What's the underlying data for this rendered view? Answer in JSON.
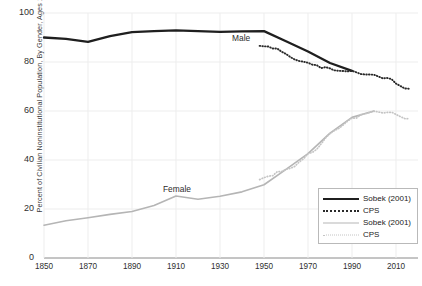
{
  "chart_data": {
    "type": "line",
    "title": "",
    "xlabel": "",
    "ylabel": "Percent of Civilian Noninstitutional Population, By Gender, Ages 16+",
    "xlim": [
      1850,
      2020
    ],
    "ylim": [
      0,
      100
    ],
    "xticks": [
      "1850",
      "1870",
      "1890",
      "1910",
      "1930",
      "1950",
      "1970",
      "1990",
      "2010"
    ],
    "xtick_values": [
      1850,
      1870,
      1890,
      1910,
      1930,
      1950,
      1970,
      1990,
      2010
    ],
    "yticks": [
      "0",
      "20",
      "40",
      "60",
      "80",
      "100"
    ],
    "ytick_values": [
      0,
      20,
      40,
      60,
      80,
      100
    ],
    "grid": true,
    "legend_position": "bottom-right",
    "annotations": [
      {
        "text": "Male",
        "x": 1952,
        "y": 88
      },
      {
        "text": "Female",
        "x": 1918,
        "y": 33
      }
    ],
    "legend": [
      {
        "label": "Sobek (2001)",
        "style": "solid",
        "color": "#1f1f1f",
        "width": 2.6
      },
      {
        "label": "CPS",
        "style": "dotted",
        "color": "#2a2a2a",
        "width": 2.0
      },
      {
        "label": "Sobek (2001)",
        "style": "solid",
        "color": "#b5b5b5",
        "width": 1.6
      },
      {
        "label": "CPS",
        "style": "dotted",
        "color": "#c4c4c4",
        "width": 1.6
      }
    ],
    "series": [
      {
        "name": "Male Sobek (2001)",
        "gender": "male",
        "source": "Sobek (2001)",
        "style": "solid",
        "color": "#1f1f1f",
        "x": [
          1850,
          1860,
          1870,
          1880,
          1890,
          1900,
          1910,
          1920,
          1930,
          1940,
          1950,
          1960,
          1970,
          1980,
          1990
        ],
        "values": [
          90.0,
          89.4,
          88.2,
          90.6,
          92.2,
          92.6,
          92.9,
          92.6,
          92.3,
          92.5,
          92.6,
          88.5,
          84.3,
          79.6,
          76.4
        ]
      },
      {
        "name": "Male CPS",
        "gender": "male",
        "source": "CPS",
        "style": "dotted",
        "color": "#2a2a2a",
        "x": [
          1948,
          1950,
          1952,
          1954,
          1956,
          1958,
          1960,
          1962,
          1964,
          1966,
          1968,
          1970,
          1972,
          1974,
          1976,
          1978,
          1980,
          1982,
          1984,
          1986,
          1988,
          1990,
          1992,
          1994,
          1996,
          1998,
          2000,
          2002,
          2004,
          2006,
          2008,
          2010,
          2012,
          2014,
          2016
        ],
        "values": [
          86.6,
          86.4,
          86.3,
          85.5,
          85.5,
          84.2,
          83.3,
          82.0,
          81.0,
          80.4,
          80.1,
          79.7,
          78.9,
          78.7,
          77.5,
          77.9,
          77.4,
          76.6,
          76.4,
          76.3,
          76.2,
          76.4,
          75.8,
          75.1,
          74.9,
          74.9,
          74.8,
          74.1,
          73.3,
          73.5,
          73.0,
          71.2,
          70.2,
          69.2,
          69.1
        ]
      },
      {
        "name": "Female Sobek (2001)",
        "gender": "female",
        "source": "Sobek (2001)",
        "style": "solid",
        "color": "#b5b5b5",
        "x": [
          1850,
          1860,
          1870,
          1880,
          1890,
          1900,
          1910,
          1920,
          1930,
          1940,
          1950,
          1960,
          1970,
          1980,
          1990,
          2000
        ],
        "values": [
          13.4,
          15.2,
          16.4,
          17.8,
          19.0,
          21.4,
          25.3,
          24.0,
          25.2,
          27.0,
          29.9,
          36.2,
          42.6,
          51.0,
          57.4,
          60.0
        ]
      },
      {
        "name": "Female CPS",
        "gender": "female",
        "source": "CPS",
        "style": "dotted",
        "color": "#c4c4c4",
        "x": [
          1948,
          1950,
          1952,
          1954,
          1956,
          1958,
          1960,
          1962,
          1964,
          1966,
          1968,
          1970,
          1972,
          1974,
          1976,
          1978,
          1980,
          1982,
          1984,
          1986,
          1988,
          1990,
          1992,
          1994,
          1996,
          1998,
          2000,
          2002,
          2004,
          2006,
          2008,
          2010,
          2012,
          2014,
          2016
        ],
        "values": [
          32.0,
          32.8,
          33.4,
          33.6,
          35.2,
          35.3,
          36.2,
          36.6,
          37.4,
          39.2,
          40.5,
          42.6,
          43.1,
          44.4,
          46.6,
          49.0,
          50.8,
          52.0,
          52.9,
          54.3,
          55.9,
          57.1,
          57.1,
          58.5,
          58.9,
          59.4,
          59.9,
          59.6,
          59.2,
          59.4,
          59.5,
          58.6,
          57.7,
          56.9,
          56.8
        ]
      }
    ]
  }
}
